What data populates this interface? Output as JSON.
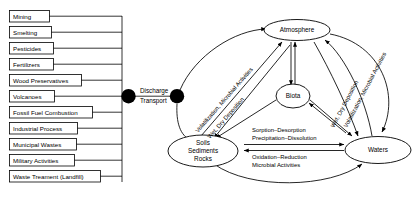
{
  "figure": {
    "caption": "",
    "colors": {
      "line": "#000000",
      "fill": "#ffffff",
      "hub": "#000000",
      "caption": "#b9b9b9"
    }
  },
  "sources": {
    "items": [
      {
        "label": "Mining"
      },
      {
        "label": "Smelting"
      },
      {
        "label": "Pesticides"
      },
      {
        "label": "Fertilizers"
      },
      {
        "label": "Wood Preservatives"
      },
      {
        "label": "Volcanoes"
      },
      {
        "label": "Fossil Fuel Combustion"
      },
      {
        "label": "Industrial Process"
      },
      {
        "label": "Municipal Wastes"
      },
      {
        "label": "Military Activities"
      },
      {
        "label": "Waste Treament (Landfill)"
      }
    ]
  },
  "hub": {
    "line1": "Discharge",
    "line2": "Transport"
  },
  "compartments": {
    "atmosphere": {
      "label": "Atmosphere"
    },
    "biota": {
      "label": "Biota"
    },
    "soils": {
      "line1": "Soils",
      "line2": "Sediments",
      "line3": "Rocks"
    },
    "waters": {
      "label": "Waters"
    }
  },
  "processes": {
    "left_volatilization": "Volatilization, Microbial Activities",
    "left_deposition": "Wet, Dry Deposition",
    "right_volatilization": "Volatilization, Microbial Activities",
    "right_deposition": "Wet, Dry Deposition",
    "soil_water_upper_line1": "Sorption–Desorption",
    "soil_water_upper_line2": "Precipitation–Dissolution",
    "soil_water_lower_line1": "Oxidation–Reduction",
    "soil_water_lower_line2": "Microbial Activities"
  }
}
